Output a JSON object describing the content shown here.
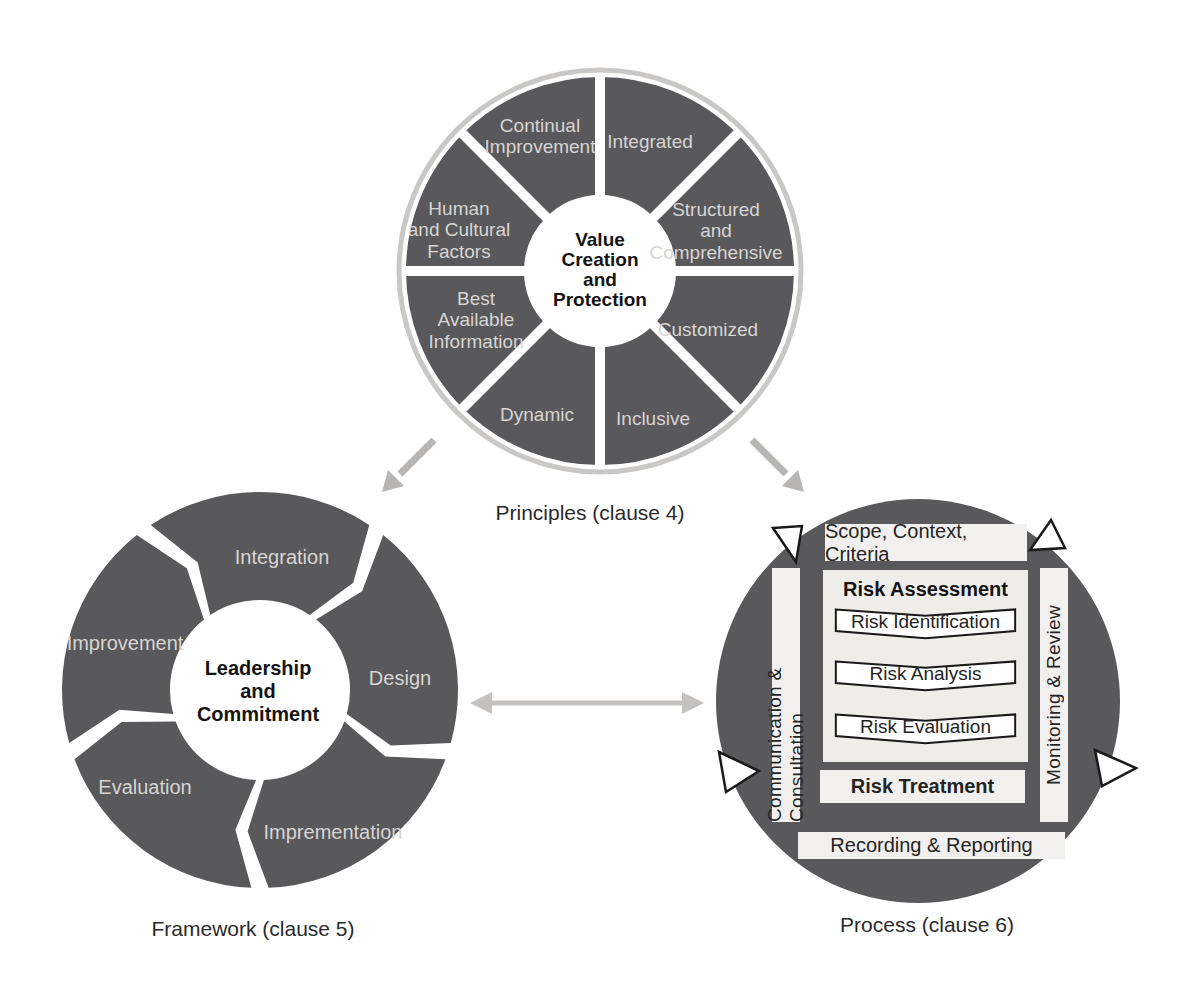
{
  "palette": {
    "disc_dark": "#59585a",
    "ring_gray": "#c9c8c6",
    "label_light": "#d6d5d3",
    "bar_light": "#f2f0ee",
    "panel_light": "#efedea",
    "arrow_gray": "#b7b6b5",
    "double_arrow_gray": "#c3c2c0",
    "text_dark": "#2b2b2b"
  },
  "principles": {
    "caption": "Principles (clause 4)",
    "hub": "Value\nCreation\nand\nProtection",
    "segments": [
      "Continual\nImprovement",
      "Integrated",
      "Structured\nand\nComprehensive",
      "Customized",
      "Inclusive",
      "Dynamic",
      "Best\nAvailable\nInformation",
      "Human\nand Cultural\nFactors"
    ]
  },
  "framework": {
    "caption": "Framework (clause 5)",
    "hub": "Leadership\nand\nCommitment",
    "segments": [
      "Integration",
      "Design",
      "Imprementation",
      "Evaluation",
      "Improvement"
    ]
  },
  "process": {
    "caption": "Process (clause 6)",
    "top_bar": "Scope, Context, Criteria",
    "left_bar": "Communication & Consultation",
    "right_bar": "Monitoring & Review",
    "assessment_title": "Risk Assessment",
    "assessment_steps": [
      "Risk Identification",
      "Risk Analysis",
      "Risk Evaluation"
    ],
    "treatment": "Risk Treatment",
    "bottom_bar": "Recording & Reporting"
  }
}
